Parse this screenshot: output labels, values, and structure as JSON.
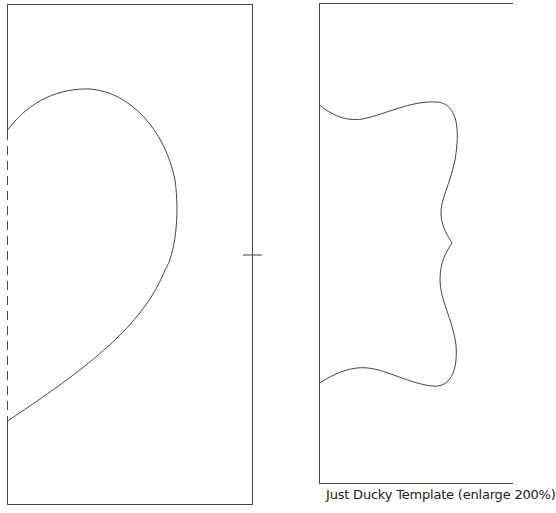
{
  "document": {
    "caption": "Just Ducky Template (enlarge 200%)",
    "line_color": "#333333",
    "background": "#ffffff"
  },
  "pieces": [
    {
      "name": "left-panel",
      "shape": "half-heart / body curve",
      "fold_line": "dashed along left edge"
    },
    {
      "name": "right-panel",
      "shape": "wavy wing/tail outline"
    }
  ],
  "marks": {
    "center_registration": "crosshair on left panel right edge"
  }
}
